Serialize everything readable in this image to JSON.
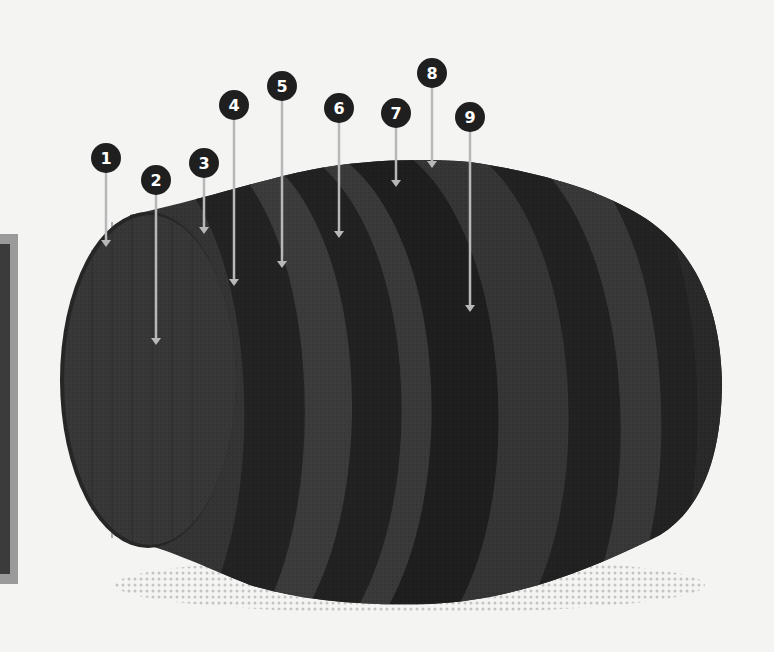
{
  "diagram": {
    "colors": {
      "background": "#f4f4f3",
      "stave_light": "#3a3a3a",
      "stave_mid": "#333333",
      "hoop_dark": "#222222",
      "callout_fill": "#1f1f1f",
      "callout_text": "#ffffff",
      "leader_line": "#b8b8b8",
      "shadow_dots": "#c4c4c4",
      "side_panel_border": "#9a9a9a",
      "side_panel_fill": "#3b3b3b"
    },
    "callouts": [
      {
        "label": "1",
        "cx": 106,
        "cy": 158,
        "tip_y": 247
      },
      {
        "label": "2",
        "cx": 156,
        "cy": 180,
        "tip_y": 345
      },
      {
        "label": "3",
        "cx": 204,
        "cy": 163,
        "tip_y": 234
      },
      {
        "label": "4",
        "cx": 234,
        "cy": 105,
        "tip_y": 286
      },
      {
        "label": "5",
        "cx": 282,
        "cy": 86,
        "tip_y": 268
      },
      {
        "label": "6",
        "cx": 339,
        "cy": 108,
        "tip_y": 238
      },
      {
        "label": "7",
        "cx": 396,
        "cy": 113,
        "tip_y": 187
      },
      {
        "label": "8",
        "cx": 432,
        "cy": 73,
        "tip_y": 168
      },
      {
        "label": "9",
        "cx": 470,
        "cy": 117,
        "tip_y": 312
      }
    ]
  }
}
